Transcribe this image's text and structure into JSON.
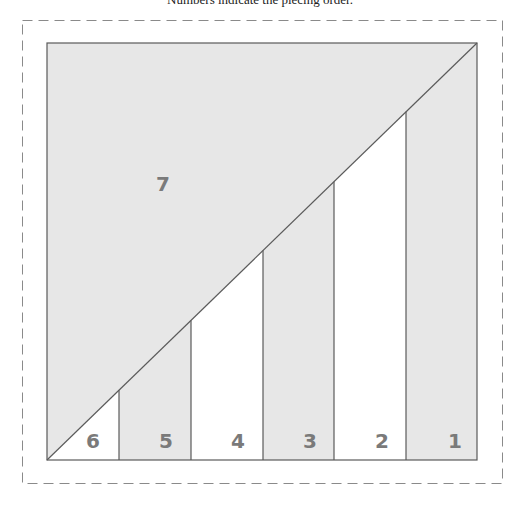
{
  "caption": "Numbers indicate the piecing order.",
  "colors": {
    "gray_fill": "#e7e7e7",
    "white_fill": "#ffffff",
    "line": "#5a5a5a",
    "dash": "#8a8a8a",
    "number": "#7a7a7a"
  },
  "pieces": [
    {
      "label": "1",
      "fill": "gray",
      "column": 6
    },
    {
      "label": "2",
      "fill": "white",
      "column": 5
    },
    {
      "label": "3",
      "fill": "gray",
      "column": 4
    },
    {
      "label": "4",
      "fill": "white",
      "column": 3
    },
    {
      "label": "5",
      "fill": "gray",
      "column": 2
    },
    {
      "label": "6",
      "fill": "white",
      "column": 1
    },
    {
      "label": "7",
      "fill": "gray",
      "region": "upper-left triangle"
    }
  ],
  "labels": {
    "p1": "1",
    "p2": "2",
    "p3": "3",
    "p4": "4",
    "p5": "5",
    "p6": "6",
    "p7": "7"
  }
}
